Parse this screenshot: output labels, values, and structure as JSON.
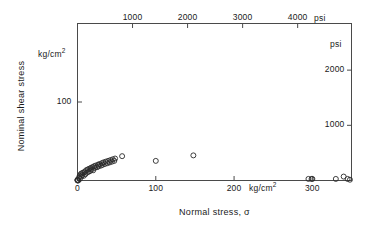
{
  "chart_data": {
    "type": "scatter",
    "title": "",
    "xlabel": "Normal stress, σ",
    "ylabel": "Nominal shear stress",
    "x_unit_primary": "kg/cm2",
    "x_unit_secondary": "psi",
    "y_unit_primary": "kg/cm2",
    "y_unit_secondary": "psi",
    "xlim": [
      0,
      350
    ],
    "ylim": [
      0,
      200
    ],
    "xlim_psi": [
      0,
      4978
    ],
    "ylim_psi": [
      0,
      2845
    ],
    "grid": false,
    "legend": null,
    "bottom_ticks": [
      0,
      100,
      200,
      300
    ],
    "bottom_tick_labels": [
      "0",
      "100",
      "200",
      "300"
    ],
    "top_ticks_psi": [
      1000,
      2000,
      3000,
      4000
    ],
    "top_tick_labels": [
      "1000",
      "2000",
      "3000",
      "4000"
    ],
    "left_ticks": [
      100
    ],
    "left_tick_labels": [
      "100"
    ],
    "right_ticks_psi": [
      1000,
      2000
    ],
    "right_tick_labels": [
      "1000",
      "2000"
    ],
    "marker": "open-circle",
    "marker_color": "#1a1a1a",
    "marker_fill": "none",
    "points": [
      [
        0,
        0
      ],
      [
        0,
        0.5
      ],
      [
        0,
        1
      ],
      [
        1,
        0
      ],
      [
        2,
        4
      ],
      [
        3,
        6
      ],
      [
        3,
        2
      ],
      [
        4,
        8
      ],
      [
        5,
        5
      ],
      [
        5,
        9
      ],
      [
        6,
        7
      ],
      [
        7,
        10
      ],
      [
        8,
        6
      ],
      [
        9,
        11
      ],
      [
        10,
        8
      ],
      [
        11,
        13
      ],
      [
        12,
        10
      ],
      [
        13,
        14
      ],
      [
        14,
        11
      ],
      [
        15,
        15
      ],
      [
        16,
        12
      ],
      [
        17,
        16
      ],
      [
        18,
        14
      ],
      [
        19,
        17
      ],
      [
        20,
        13
      ],
      [
        21,
        18
      ],
      [
        22,
        16
      ],
      [
        23,
        19
      ],
      [
        25,
        17
      ],
      [
        26,
        20
      ],
      [
        27,
        18
      ],
      [
        28,
        21
      ],
      [
        30,
        19
      ],
      [
        31,
        22
      ],
      [
        32,
        20
      ],
      [
        33,
        23
      ],
      [
        35,
        21
      ],
      [
        36,
        24
      ],
      [
        38,
        22
      ],
      [
        39,
        25
      ],
      [
        41,
        23
      ],
      [
        42,
        26
      ],
      [
        44,
        24
      ],
      [
        45,
        27
      ],
      [
        47,
        25
      ],
      [
        48,
        28
      ],
      [
        57,
        31
      ],
      [
        100,
        25
      ],
      [
        148,
        32
      ],
      [
        295,
        2
      ],
      [
        299,
        2
      ],
      [
        300,
        2
      ],
      [
        330,
        2
      ],
      [
        340,
        5
      ],
      [
        345,
        2
      ],
      [
        348,
        1
      ]
    ]
  },
  "axes": {
    "left_unit": "kg/cm",
    "left_unit_sup": "2",
    "right_unit": "psi",
    "top_unit": "psi",
    "bottom_unit": "kg/cm",
    "bottom_unit_sup": "2",
    "ylabel": "Nominal shear stress",
    "xlabel": "Normal stress, σ"
  },
  "colors": {
    "frame": "#4a4a4a",
    "text": "#1a1a1a",
    "marker": "#2a2a2a",
    "background": "#ffffff"
  }
}
